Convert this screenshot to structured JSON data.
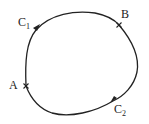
{
  "diagram": {
    "type": "closed-contour",
    "stroke_color": "#222222",
    "points": [
      {
        "id": "A",
        "label": "A",
        "marker": "x"
      },
      {
        "id": "B",
        "label": "B",
        "marker": "x"
      }
    ],
    "paths": [
      {
        "id": "C1",
        "label": "C",
        "subscript": "1",
        "from": "A",
        "to": "B",
        "arrow": "forward"
      },
      {
        "id": "C2",
        "label": "C",
        "subscript": "2",
        "from": "B",
        "to": "A",
        "arrow": "forward"
      }
    ]
  }
}
